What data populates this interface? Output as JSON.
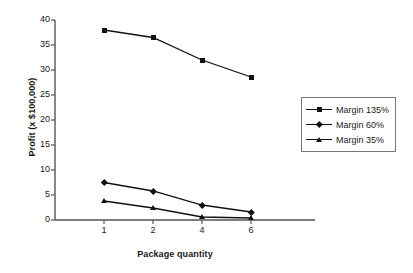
{
  "chart_data": {
    "type": "line",
    "title": "",
    "xlabel": "Package quantity",
    "ylabel": "Profit (x $100,000)",
    "categories": [
      "1",
      "2",
      "4",
      "6"
    ],
    "x": [
      1,
      2,
      4,
      6
    ],
    "xlim": [
      0,
      5
    ],
    "ylim": [
      0,
      40
    ],
    "yticks": [
      "0",
      "5",
      "10",
      "15",
      "20",
      "25",
      "30",
      "35",
      "40"
    ],
    "ytick_values": [
      0,
      5,
      10,
      15,
      20,
      25,
      30,
      35,
      40
    ],
    "grid": false,
    "legend_position": "right",
    "series": [
      {
        "name": "Margin 135%",
        "marker": "square",
        "color": "#111111",
        "values": [
          38.0,
          36.5,
          32.0,
          28.6
        ]
      },
      {
        "name": "Margin 60%",
        "marker": "diamond",
        "color": "#111111",
        "values": [
          7.5,
          5.8,
          3.0,
          1.6
        ]
      },
      {
        "name": "Margin 35%",
        "marker": "triangle",
        "color": "#111111",
        "values": [
          3.8,
          2.4,
          0.6,
          0.4
        ]
      }
    ]
  },
  "axis": {
    "y_label": "Profit (x $100,000)",
    "x_label": "Package quantity"
  },
  "legend": {
    "entries": [
      {
        "label": "Margin 135%"
      },
      {
        "label": "Margin 60%"
      },
      {
        "label": "Margin 35%"
      }
    ]
  }
}
